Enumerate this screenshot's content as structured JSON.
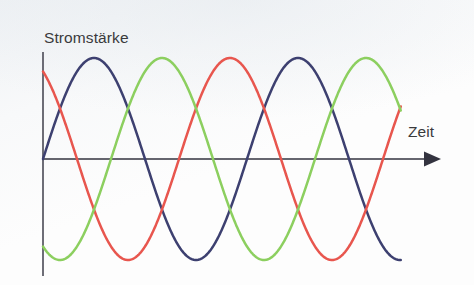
{
  "figure": {
    "kind": "three-phase-current-waveform-diagram",
    "background_color": "#fdfdfd",
    "axis_color": "#4a4a55",
    "label_color": "#3a3a3c",
    "y_axis_label": "Stromstärke",
    "x_axis_label": "Zeit",
    "x_axis_arrow": "arrow-right-icon"
  },
  "chart_data": {
    "type": "line",
    "title": "",
    "subtitle": "",
    "xlabel": "Zeit",
    "ylabel": "Stromstärke",
    "xlim": [
      0,
      2.0
    ],
    "ylim": [
      -1.15,
      1.15
    ],
    "grid": false,
    "legend": "none",
    "annotations": [],
    "x_tick_labels": [],
    "y_tick_labels": [],
    "geometry": {
      "origin_x_px": 43,
      "zero_line_y_px": 159,
      "amplitude_px": 101,
      "period_px": 204,
      "curve_start_x_px": 43,
      "curve_end_x_px": 401,
      "y_axis_top_px": 52,
      "y_axis_bottom_px": 276,
      "x_axis_end_px": 441
    },
    "series": [
      {
        "name": "L1",
        "color": "#3d4070",
        "phase_deg": 0,
        "amplitude": 1.0,
        "start_value": 0.0,
        "peak_x_px": 96,
        "values": [
          0.0,
          0.5,
          0.87,
          1.0,
          0.87,
          0.5,
          0.0,
          -0.5,
          -0.87,
          -1.0,
          -0.87,
          -0.5,
          0.0,
          0.5,
          0.87,
          1.0,
          0.87,
          0.5,
          0.0,
          -0.5,
          -0.87,
          -1.0,
          -0.87,
          -0.5,
          0.0,
          0.5,
          0.87,
          1.0,
          0.87,
          0.5,
          0.0,
          -0.5,
          -0.87,
          -1.0
        ]
      },
      {
        "name": "L2",
        "color": "#e8564e",
        "phase_deg": 120,
        "amplitude": 1.0,
        "start_value": 0.87,
        "peak_x_px": 232,
        "values": [
          0.87,
          1.0,
          0.87,
          0.5,
          0.0,
          -0.5,
          -0.87,
          -1.0,
          -0.87,
          -0.5,
          0.0,
          0.5,
          0.87,
          1.0,
          0.87,
          0.5,
          0.0,
          -0.5,
          -0.87,
          -1.0,
          -0.87,
          -0.5,
          0.0,
          0.5,
          0.87,
          1.0,
          0.87,
          0.5,
          0.0,
          -0.5,
          -0.87,
          -1.0,
          -0.87,
          -0.5
        ]
      },
      {
        "name": "L3",
        "color": "#8ccf5f",
        "phase_deg": 240,
        "amplitude": 1.0,
        "start_value": -0.87,
        "peak_x_px": 164,
        "values": [
          -0.87,
          -0.5,
          0.0,
          0.5,
          0.87,
          1.0,
          0.87,
          0.5,
          0.0,
          -0.5,
          -0.87,
          -1.0,
          -0.87,
          -0.5,
          0.0,
          0.5,
          0.87,
          1.0,
          0.87,
          0.5,
          0.0,
          -0.5,
          -0.87,
          -1.0,
          -0.87,
          -0.5,
          0.0,
          0.5,
          0.87,
          1.0,
          0.87,
          0.5,
          0.0,
          -0.5
        ]
      }
    ]
  }
}
